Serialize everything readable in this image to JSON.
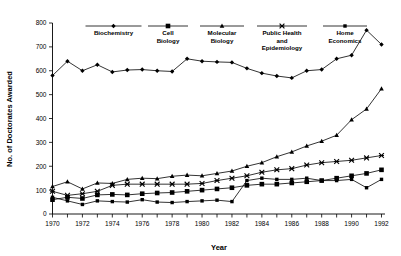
{
  "chart_data": {
    "type": "line",
    "title": "",
    "xlabel": "Year",
    "ylabel": "No. of Doctorates Awarded",
    "xlim": [
      1970,
      1992
    ],
    "ylim": [
      0,
      800
    ],
    "ytick_step": 100,
    "xtick_step": 1,
    "xticklabel_step": 2,
    "grid": false,
    "legend_position": "top",
    "x": [
      1970,
      1971,
      1972,
      1973,
      1974,
      1975,
      1976,
      1977,
      1978,
      1979,
      1980,
      1981,
      1982,
      1983,
      1984,
      1985,
      1986,
      1987,
      1988,
      1989,
      1990,
      1991,
      1992
    ],
    "xticklabels": [
      "1970",
      "1972",
      "1974",
      "1976",
      "1978",
      "1980",
      "1982",
      "1984",
      "1986",
      "1988",
      "1990",
      "1992"
    ],
    "yticklabels": [
      "0",
      "100",
      "200",
      "300",
      "400",
      "500",
      "600",
      "700",
      "800"
    ],
    "series": [
      {
        "name": "Biochemistry",
        "marker": "diamond",
        "values": [
          580,
          640,
          600,
          625,
          595,
          603,
          605,
          600,
          597,
          650,
          640,
          637,
          635,
          610,
          590,
          578,
          570,
          600,
          605,
          650,
          665,
          770,
          710
        ]
      },
      {
        "name": "Cell Biology",
        "marker": "square",
        "values": [
          60,
          70,
          65,
          80,
          82,
          80,
          85,
          88,
          90,
          95,
          100,
          105,
          110,
          120,
          125,
          125,
          130,
          135,
          140,
          150,
          160,
          170,
          185
        ]
      },
      {
        "name": "Molecular Biology",
        "marker": "triangle",
        "values": [
          115,
          135,
          105,
          130,
          128,
          145,
          150,
          148,
          158,
          163,
          160,
          170,
          180,
          200,
          215,
          240,
          260,
          285,
          305,
          330,
          395,
          440,
          525
        ]
      },
      {
        "name": "Public Health and Epidemiology",
        "marker": "x",
        "values": [
          95,
          78,
          85,
          95,
          120,
          125,
          125,
          125,
          125,
          125,
          128,
          140,
          150,
          160,
          175,
          185,
          190,
          205,
          215,
          220,
          225,
          235,
          245
        ]
      },
      {
        "name": "Home Economics",
        "marker": "small-square",
        "values": [
          70,
          55,
          40,
          55,
          52,
          50,
          60,
          50,
          48,
          52,
          55,
          58,
          52,
          140,
          150,
          145,
          145,
          150,
          140,
          140,
          145,
          110,
          145
        ]
      }
    ]
  },
  "legend": {
    "items": [
      {
        "label_lines": [
          "Biochemistry"
        ],
        "marker": "diamond"
      },
      {
        "label_lines": [
          "Cell",
          "Biology"
        ],
        "marker": "square"
      },
      {
        "label_lines": [
          "Molecular",
          "Biology"
        ],
        "marker": "triangle"
      },
      {
        "label_lines": [
          "Public Health",
          "and",
          "Epidemiology"
        ],
        "marker": "x"
      },
      {
        "label_lines": [
          "Home",
          "Economics"
        ],
        "marker": "small-square"
      }
    ]
  },
  "colors": {
    "ink": "#000000",
    "background": "#ffffff"
  }
}
